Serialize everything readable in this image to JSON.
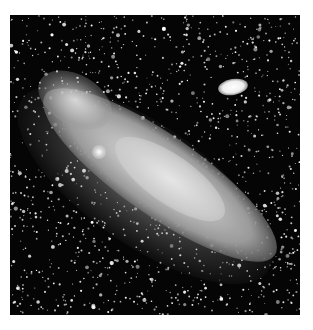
{
  "image": {
    "subject": "spiral galaxy with satellite galaxy in dense star field",
    "palette": {
      "background": "#ffffff",
      "sky": "#050505",
      "galaxy_core": "#d6d6d6",
      "stars": "#ffffff"
    },
    "satellite_galaxy": "bright elliptical companion, upper right"
  }
}
